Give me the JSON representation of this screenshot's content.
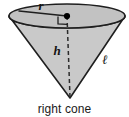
{
  "figure": {
    "title": "right cone",
    "caption": "right cone",
    "shape_name": "right cone",
    "labels": {
      "radius": "r",
      "height": "h",
      "slant_height": "ℓ"
    },
    "colors": {
      "body_fill": "#c9c9c9",
      "top_fill": "#c2c2c2",
      "outline": "#1f1f1f",
      "dashed_line": "#2b2b2b",
      "center_dot": "#000000",
      "background": "#ffffff",
      "text": "#1a1a1a"
    },
    "geometry": {
      "ellipse_center_x": 67,
      "ellipse_center_y": 16,
      "ellipse_radius_x": 58,
      "ellipse_radius_y": 12,
      "apex_x": 70,
      "apex_y": 98
    }
  }
}
